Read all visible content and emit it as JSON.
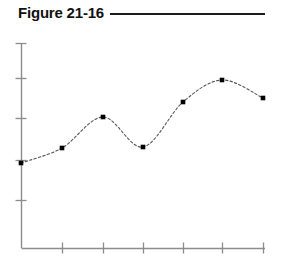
{
  "figure": {
    "caption": "Figure 21-16",
    "rule_color": "#1a1a1a"
  },
  "chart_data": {
    "type": "line",
    "title": "Figure 21-16",
    "xlabel": "",
    "ylabel": "",
    "grid": false,
    "legend": "none",
    "marker": "filled-square",
    "marker_color": "#000000",
    "line_style": "dashed",
    "line_color": "#555555",
    "axis_color": "#8c8c8c",
    "xlim": [
      0,
      7
    ],
    "ylim": [
      0,
      5
    ],
    "x_tick_labels": [
      "",
      "",
      "",
      "",
      "",
      "",
      ""
    ],
    "y_tick_labels": [
      "",
      "",
      "",
      ""
    ],
    "x": [
      0,
      1,
      2,
      3,
      4,
      5,
      6
    ],
    "values": [
      2.05,
      2.4,
      3.15,
      2.42,
      3.55,
      4.07,
      3.64
    ],
    "series": [
      {
        "name": "series-1",
        "points": [
          {
            "x": 0,
            "y": 2.05,
            "px": 21,
            "py": 163
          },
          {
            "x": 1,
            "y": 2.4,
            "px": 62,
            "py": 148
          },
          {
            "x": 2,
            "y": 3.15,
            "px": 103,
            "py": 117
          },
          {
            "x": 3,
            "y": 2.42,
            "px": 143,
            "py": 147
          },
          {
            "x": 4,
            "y": 3.55,
            "px": 183,
            "py": 102
          },
          {
            "x": 5,
            "y": 4.07,
            "px": 222,
            "py": 80
          },
          {
            "x": 6,
            "y": 3.64,
            "px": 263,
            "py": 98
          }
        ]
      }
    ],
    "axes": {
      "x_axis_px": {
        "x1": 21,
        "x2": 265,
        "y": 248
      },
      "y_axis_px": {
        "y1": 43,
        "y2": 248,
        "x": 21
      },
      "x_ticks_px": [
        62,
        103,
        143,
        183,
        222,
        263
      ],
      "y_ticks_px": [
        78,
        118,
        160,
        200
      ]
    }
  }
}
